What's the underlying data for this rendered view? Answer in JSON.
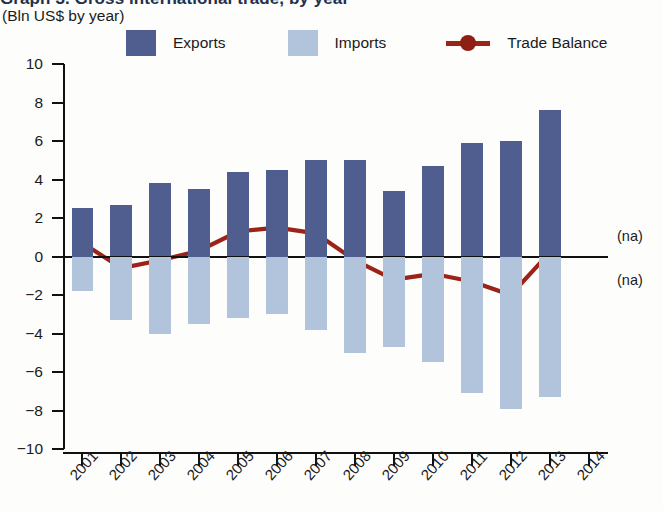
{
  "title": {
    "main": "Graph 3. Gross international trade, by year",
    "subtitle": "(Bln US$ by year)"
  },
  "legend": {
    "items": [
      {
        "label": "Exports",
        "type": "swatch",
        "color": "#4f5e8e",
        "name": "legend-exports"
      },
      {
        "label": "Imports",
        "type": "swatch",
        "color": "#b2c4dc",
        "name": "legend-imports"
      },
      {
        "label": "Trade Balance",
        "type": "line",
        "color": "#9b2318",
        "name": "legend-trade-balance"
      }
    ]
  },
  "annotations": {
    "na_above": "(na)",
    "na_below": "(na)"
  },
  "axes": {
    "y_ticks": [
      "10",
      "8",
      "6",
      "4",
      "2",
      "0",
      "-2",
      "-4",
      "-6",
      "-8",
      "-10"
    ],
    "x_ticks": [
      "2001",
      "2002",
      "2003",
      "2004",
      "2005",
      "2006",
      "2007",
      "2008",
      "2009",
      "2010",
      "2011",
      "2012",
      "2013",
      "2014"
    ]
  },
  "chart_data": {
    "type": "bar",
    "title": "Graph 3. Gross international trade, by year",
    "subtitle": "(Bln US$ by year)",
    "xlabel": "",
    "ylabel": "Bln US$",
    "ylim": [
      -10,
      10
    ],
    "ytick_step": 2,
    "grid": false,
    "legend_position": "top",
    "categories": [
      "2001",
      "2002",
      "2003",
      "2004",
      "2005",
      "2006",
      "2007",
      "2008",
      "2009",
      "2010",
      "2011",
      "2012",
      "2013",
      "2014"
    ],
    "series": [
      {
        "name": "Exports",
        "type": "bar",
        "color": "#4f5e8e",
        "values": [
          2.5,
          2.7,
          3.8,
          3.5,
          4.4,
          4.5,
          5.0,
          5.0,
          3.4,
          4.7,
          5.9,
          6.0,
          7.6,
          null
        ]
      },
      {
        "name": "Imports",
        "type": "bar",
        "color": "#b2c4dc",
        "values": [
          -1.8,
          -3.3,
          -4.0,
          -3.5,
          -3.2,
          -3.0,
          -3.8,
          -5.0,
          -4.7,
          -5.5,
          -7.1,
          -7.9,
          -7.3,
          null
        ]
      },
      {
        "name": "Trade Balance",
        "type": "line",
        "color": "#9b2318",
        "values": [
          0.7,
          -0.6,
          -0.2,
          0.3,
          1.3,
          1.5,
          1.2,
          -0.2,
          -1.2,
          -0.9,
          -1.3,
          -2.0,
          0.2,
          null
        ]
      }
    ]
  }
}
